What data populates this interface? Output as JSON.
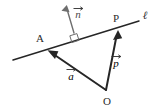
{
  "figure": {
    "kind": "vector-geometry-diagram",
    "background_color": "#ffffff",
    "width": 160,
    "height": 110,
    "ink_color": "#262626",
    "light_ink_color": "#6e6e6e"
  },
  "labels": {
    "line": "ℓ",
    "point_a": "A",
    "point_p": "P",
    "origin": "O",
    "vector_a": "a",
    "vector_p": "p",
    "vector_n": "n"
  },
  "points": {
    "A": {
      "x": 48,
      "y": 50,
      "label_x": 40,
      "label_y": 42
    },
    "P": {
      "x": 118,
      "y": 30,
      "label_x": 116,
      "label_y": 22
    },
    "O": {
      "x": 106,
      "y": 90,
      "label_x": 107,
      "label_y": 104
    },
    "foot_of_normal": {
      "x": 75,
      "y": 41
    },
    "line_start": {
      "x": 13,
      "y": 60
    },
    "line_end": {
      "x": 139,
      "y": 21
    },
    "normal_tip": {
      "x": 66,
      "y": 6
    },
    "line_label_pos": {
      "x": 145,
      "y": 19
    }
  },
  "vectors": [
    {
      "name": "vector-a",
      "glyph": "a",
      "from": "O",
      "to": "A",
      "label_x": 71,
      "label_y": 78,
      "style": "solid-dark"
    },
    {
      "name": "vector-p",
      "glyph": "p",
      "from": "O",
      "to": "P",
      "label_x": 115,
      "label_y": 65,
      "style": "solid-dark"
    },
    {
      "name": "vector-n",
      "glyph": "n",
      "from": "foot_of_normal",
      "to": "normal_tip",
      "label_x": 75,
      "label_y": 14,
      "style": "solid-light",
      "perpendicular_to": "ℓ"
    }
  ],
  "markers": {
    "right_angle": {
      "name": "right-angle-marker",
      "at_x": 75,
      "at_y": 41,
      "size": 7
    }
  }
}
